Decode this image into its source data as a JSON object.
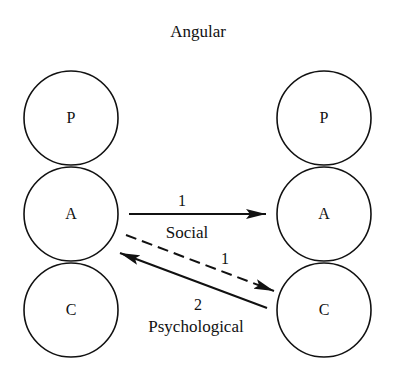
{
  "title": "Angular",
  "left_stack": {
    "top": "P",
    "middle": "A",
    "bottom": "C"
  },
  "right_stack": {
    "top": "P",
    "middle": "A",
    "bottom": "C"
  },
  "transactions": {
    "social": {
      "number": "1",
      "label": "Social",
      "from": "A",
      "to": "A",
      "style": "solid"
    },
    "ulterior": {
      "number": "1",
      "from": "A",
      "to": "C",
      "style": "dashed"
    },
    "psychological": {
      "number": "2",
      "label": "Psychological",
      "from": "C",
      "to": "A",
      "style": "solid"
    }
  },
  "colors": {
    "stroke": "#111111",
    "background": "#ffffff"
  }
}
